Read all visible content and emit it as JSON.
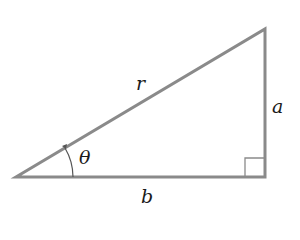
{
  "diagram": {
    "labels": {
      "hypotenuse": "r",
      "opposite": "a",
      "adjacent": "b",
      "angle": "θ"
    },
    "colors": {
      "line": "#8a8a8a",
      "text": "#1a1a1a",
      "background": "#ffffff"
    },
    "vertices": {
      "left": [
        16,
        177
      ],
      "right_bottom": [
        265,
        177
      ],
      "top": [
        265,
        29
      ]
    }
  }
}
